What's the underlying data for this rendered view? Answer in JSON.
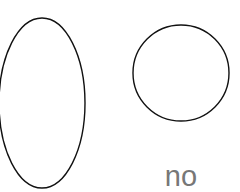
{
  "shapes": [
    {
      "type": "ellipse",
      "cx": 42,
      "cy": 103,
      "rx": 43,
      "ry": 85,
      "stroke": "#111111"
    },
    {
      "type": "circle",
      "cx": 181,
      "cy": 73,
      "r": 48,
      "stroke": "#111111"
    }
  ],
  "label": {
    "text": "no",
    "color": "#777777"
  }
}
